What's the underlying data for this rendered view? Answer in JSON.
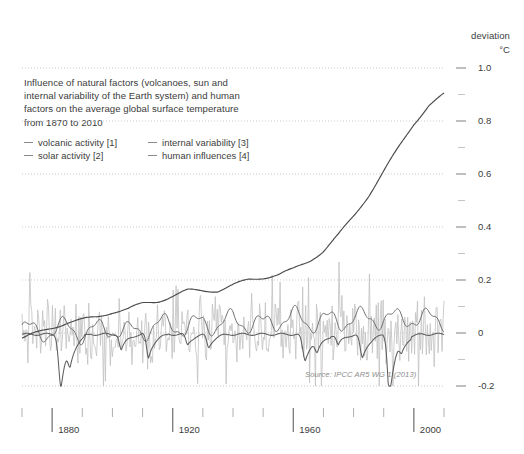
{
  "axis_header": {
    "deviation": "deviation",
    "unit": "°C"
  },
  "title": {
    "line1": "Influence of natural factors (volcanoes, sun and",
    "line2": "internal variability of the Earth system) and human",
    "line3": "factors on the average global surface temperature",
    "line4": "from 1870 to 2010"
  },
  "legend": {
    "items": [
      {
        "label": "volcanic activity [1]"
      },
      {
        "label": "internal variability [3]"
      },
      {
        "label": "solar activity [2]"
      },
      {
        "label": "human influences [4]"
      }
    ]
  },
  "source": "Source: IPCC AR5 WG 1 (2013)",
  "colors": {
    "text": "#3c3c3c",
    "grid": "#c9c9c9",
    "tick": "#8a8a8a",
    "axis": "#555555",
    "human": "#4a4a4a",
    "volcanic": "#5e5e5e",
    "solar": "#6f6f6f",
    "internal": "#c2c2c2",
    "background": "#ffffff"
  },
  "chart_data": {
    "type": "line",
    "title": "Influence of natural factors (volcanoes, sun and internal variability of the Earth system) and human factors on the average global surface temperature from 1870 to 2010",
    "xlabel": "",
    "ylabel": "deviation °C",
    "xlim": [
      1870,
      2010
    ],
    "ylim": [
      -0.2,
      1.0
    ],
    "grid": true,
    "legend_position": "top-left",
    "x_major_ticks": [
      1880,
      1920,
      1960,
      2000
    ],
    "x_minor_ticks": [
      1870,
      1890,
      1900,
      1910,
      1930,
      1940,
      1950,
      1970,
      1980,
      1990,
      2010
    ],
    "x_tick_labels": [
      "1880",
      "1920",
      "1960",
      "2000"
    ],
    "y_major_ticks": [
      -0.2,
      0,
      0.2,
      0.4,
      0.6,
      0.8,
      1.0
    ],
    "y_minor_ticks": [
      -0.1,
      0.1,
      0.3,
      0.5,
      0.7,
      0.9
    ],
    "y_tick_labels": [
      "1.0",
      "0.8",
      "0.6",
      "0.4",
      "0.2",
      "0",
      "-0.2"
    ],
    "x": [
      1870,
      1875,
      1880,
      1885,
      1890,
      1895,
      1900,
      1905,
      1910,
      1915,
      1920,
      1925,
      1930,
      1935,
      1940,
      1945,
      1950,
      1955,
      1960,
      1965,
      1970,
      1975,
      1980,
      1985,
      1990,
      1995,
      2000,
      2005,
      2010
    ],
    "series": [
      {
        "name": "human influences [4]",
        "key": "human",
        "values": [
          -0.02,
          0.0,
          0.02,
          0.04,
          0.05,
          0.06,
          0.08,
          0.09,
          0.11,
          0.12,
          0.14,
          0.16,
          0.16,
          0.16,
          0.18,
          0.2,
          0.21,
          0.22,
          0.24,
          0.27,
          0.31,
          0.37,
          0.44,
          0.52,
          0.61,
          0.7,
          0.79,
          0.86,
          0.9
        ]
      },
      {
        "name": "volcanic activity [1]",
        "key": "volcanic",
        "values": [
          0.0,
          -0.01,
          -0.01,
          -0.17,
          -0.03,
          -0.01,
          0.0,
          -0.02,
          -0.07,
          -0.02,
          -0.01,
          0.0,
          -0.01,
          -0.02,
          -0.01,
          0.0,
          0.0,
          0.0,
          -0.02,
          -0.06,
          -0.02,
          -0.01,
          -0.01,
          -0.05,
          -0.13,
          -0.03,
          -0.01,
          0.0,
          0.0
        ]
      },
      {
        "name": "solar activity [2]",
        "key": "solar",
        "values": [
          0.02,
          0.0,
          0.01,
          0.02,
          0.0,
          0.01,
          0.02,
          0.0,
          0.01,
          0.03,
          0.03,
          0.02,
          0.04,
          0.03,
          0.05,
          0.04,
          0.03,
          0.05,
          0.06,
          0.04,
          0.05,
          0.04,
          0.06,
          0.05,
          0.06,
          0.05,
          0.06,
          0.05,
          0.05
        ]
      },
      {
        "name": "internal variability [3]",
        "key": "internal",
        "note": "high-frequency noise band, approx ±0.15 °C around 0",
        "amplitude": 0.15
      }
    ]
  }
}
